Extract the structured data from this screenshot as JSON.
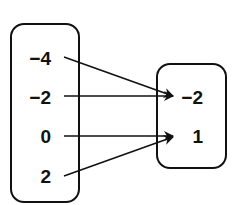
{
  "diagram": {
    "type": "mapping",
    "domain": {
      "label": "Domain",
      "values": [
        "−4",
        "−2",
        "0",
        "2"
      ]
    },
    "range": {
      "label": "Range",
      "values": [
        "−2",
        "1"
      ]
    },
    "mappings": [
      {
        "from": "−4",
        "to": "−2"
      },
      {
        "from": "−2",
        "to": "−2"
      },
      {
        "from": "0",
        "to": "1"
      },
      {
        "from": "2",
        "to": "1"
      }
    ],
    "colors": {
      "stroke": "#111111",
      "background": "#ffffff"
    }
  }
}
